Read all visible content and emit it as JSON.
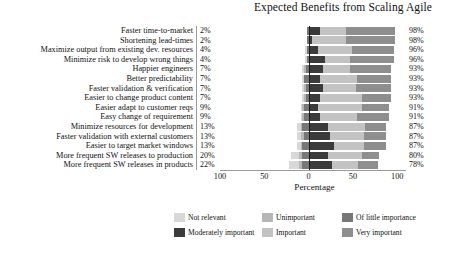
{
  "chart_data": {
    "type": "bar",
    "subtype": "diverging-stacked-likert",
    "title": "Expected Benefits from Scaling Agile",
    "xlabel": "Percentage",
    "ylabel": "",
    "xlim": [
      -100,
      100
    ],
    "xticks": [
      "100",
      "50",
      "0",
      "50",
      "100"
    ],
    "xtick_values": [
      -100,
      -50,
      0,
      50,
      100
    ],
    "grid": false,
    "legend_position": "bottom",
    "legend": [
      "Not relevant",
      "Unimportant",
      "Of little importance",
      "Moderately important",
      "Important",
      "Very important"
    ],
    "colors": {
      "not_relevant": "#d8d8d8",
      "unimportant": "#b6b6b6",
      "of_little_importance": "#777777",
      "moderately_important": "#3b3b3b",
      "important": "#c3c3c3",
      "very_important": "#8e8e8e"
    },
    "categories": [
      "Faster time-to-market",
      "Shortening lead-times",
      "Maximize output from existing dev. resources",
      "Minimize risk to develop wrong things",
      "Happier engineers",
      "Better predictability",
      "Faster validation & verification",
      "Easier to change product content",
      "Easier adapt to customer reqs",
      "Easy change of requirement",
      "Minimize resources for development",
      "Faster validation with external customers",
      "Easier to target market windows",
      "More frequent SW releases to production",
      "More frequent SW releases in products"
    ],
    "negative_totals": [
      "2%",
      "2%",
      "4%",
      "4%",
      "7%",
      "7%",
      "7%",
      "7%",
      "9%",
      "9%",
      "13%",
      "13%",
      "13%",
      "20%",
      "22%"
    ],
    "positive_totals": [
      "98%",
      "98%",
      "96%",
      "96%",
      "93%",
      "93%",
      "93%",
      "93%",
      "91%",
      "91%",
      "87%",
      "87%",
      "87%",
      "80%",
      "78%"
    ],
    "series": [
      {
        "name": "Not relevant",
        "values": [
          0,
          0,
          2,
          2,
          2,
          2,
          2,
          2,
          2,
          2,
          4,
          4,
          4,
          9,
          11
        ]
      },
      {
        "name": "Unimportant",
        "values": [
          0,
          0,
          0,
          0,
          2,
          0,
          2,
          2,
          2,
          2,
          2,
          4,
          2,
          4,
          4
        ]
      },
      {
        "name": "Of little importance",
        "values": [
          2,
          2,
          2,
          2,
          3,
          5,
          3,
          3,
          5,
          5,
          7,
          5,
          7,
          7,
          7
        ]
      },
      {
        "name": "Moderately important",
        "values": [
          13,
          4,
          11,
          18,
          16,
          13,
          16,
          13,
          11,
          13,
          22,
          24,
          29,
          22,
          27
        ]
      },
      {
        "name": "Important",
        "values": [
          29,
          38,
          38,
          29,
          31,
          42,
          38,
          47,
          49,
          42,
          42,
          38,
          33,
          38,
          29
        ]
      },
      {
        "name": "Very important",
        "values": [
          56,
          56,
          47,
          49,
          46,
          38,
          39,
          33,
          31,
          36,
          23,
          25,
          25,
          20,
          22
        ]
      }
    ]
  }
}
